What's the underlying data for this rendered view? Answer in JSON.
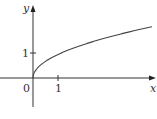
{
  "chart_data": {
    "type": "line",
    "title": "",
    "function": "y = sqrt(x)",
    "xlabel": "x",
    "ylabel": "y",
    "origin_label": "0",
    "x_ticks": [
      {
        "value": 1,
        "label": "1"
      }
    ],
    "y_ticks": [
      {
        "value": 1,
        "label": "1"
      }
    ],
    "xlim": [
      -1.3,
      4.9
    ],
    "ylim": [
      -1.0,
      3.0
    ],
    "grid": false,
    "legend": null,
    "series": [
      {
        "name": "sqrt(x)",
        "x": [
          0,
          0.05,
          0.25,
          0.5,
          1,
          1.5,
          2,
          2.5,
          3,
          3.5,
          4,
          4.5,
          4.76
        ],
        "y": [
          0,
          0.22,
          0.5,
          0.71,
          1,
          1.22,
          1.41,
          1.58,
          1.73,
          1.87,
          2,
          2.12,
          2.18
        ]
      }
    ],
    "colors": {
      "axis": "#333333",
      "curve": "#444444"
    }
  }
}
